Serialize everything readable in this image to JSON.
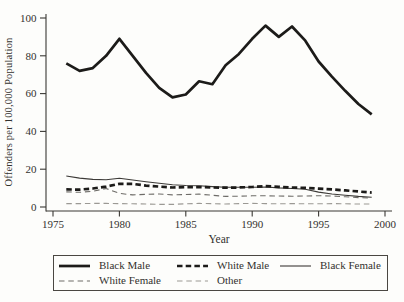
{
  "figure": {
    "background": "#fdfdfb",
    "text_color": "#33312e",
    "axis_color": "#3a3834"
  },
  "chart_data": {
    "type": "line",
    "title": "",
    "xlabel": "Year",
    "ylabel": "Offenders per 100,000 Population",
    "xlim": [
      1975,
      2000
    ],
    "ylim": [
      0,
      100
    ],
    "xticks": [
      "1975",
      "1980",
      "1985",
      "1990",
      "1995",
      "2000"
    ],
    "yticks": [
      "0",
      "20",
      "40",
      "60",
      "80",
      "100"
    ],
    "grid": false,
    "legend_position": "bottom-box",
    "x": [
      1976,
      1977,
      1978,
      1979,
      1980,
      1981,
      1982,
      1983,
      1984,
      1985,
      1986,
      1987,
      1988,
      1989,
      1990,
      1991,
      1992,
      1993,
      1994,
      1995,
      1996,
      1997,
      1998,
      1999
    ],
    "series": [
      {
        "name": "Black Male",
        "style": "solid-thick",
        "color": "#1c1b19",
        "values": [
          76,
          72,
          73.5,
          80,
          89,
          80,
          71,
          63,
          58,
          59.5,
          66.5,
          65,
          75,
          81,
          89,
          96,
          90,
          95.5,
          88,
          77,
          69,
          61.5,
          54.5,
          49
        ]
      },
      {
        "name": "White Male",
        "style": "dashed-thick",
        "color": "#1c1b19",
        "values": [
          9.3,
          9.2,
          9.8,
          10.8,
          12.3,
          12.2,
          11.3,
          10.8,
          10.3,
          10.5,
          10.6,
          10.3,
          10.2,
          10.3,
          10.6,
          11,
          10.7,
          10.3,
          10.1,
          9.7,
          9.3,
          8.8,
          8.2,
          7.6
        ]
      },
      {
        "name": "Black Female",
        "style": "solid-thin",
        "color": "#3c3a37",
        "values": [
          16.4,
          15.3,
          14.6,
          14.4,
          15.2,
          14.3,
          13.4,
          12.6,
          11.8,
          11.4,
          11.2,
          10.8,
          10.5,
          10.4,
          10.4,
          10.6,
          10.1,
          9.8,
          9.4,
          7.9,
          6.9,
          6.2,
          5.6,
          5.2
        ]
      },
      {
        "name": "White Female",
        "style": "dashed-thin",
        "color": "#6e6c68",
        "values": [
          8,
          7.8,
          8.3,
          9.8,
          7.2,
          6.4,
          6.7,
          6.9,
          6.4,
          6.6,
          6.8,
          6.2,
          5.6,
          5.7,
          5.9,
          5.9,
          5.8,
          5.7,
          5.8,
          6,
          5.8,
          5.4,
          5,
          4.7
        ]
      },
      {
        "name": "Other",
        "style": "dashed-thin",
        "color": "#9b9994",
        "values": [
          1.8,
          1.8,
          1.9,
          1.9,
          1.8,
          1.7,
          1.6,
          1.4,
          1.4,
          1.7,
          1.9,
          1.8,
          1.6,
          1.8,
          1.9,
          1.8,
          1.7,
          1.8,
          1.7,
          1.7,
          1.8,
          1.7,
          1.6,
          1.6
        ]
      }
    ],
    "legend_rows": [
      [
        0,
        1,
        2
      ],
      [
        3,
        4
      ]
    ]
  }
}
